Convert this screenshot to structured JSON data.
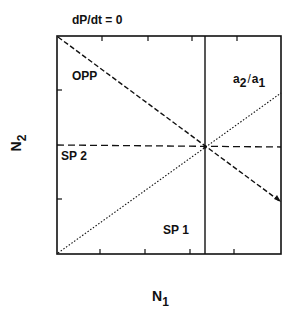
{
  "diagram": {
    "title": "dP/dt = 0",
    "x_axis": {
      "label": "N",
      "subscript": "1"
    },
    "y_axis": {
      "label": "N",
      "subscript": "2"
    },
    "regions": {
      "opp": "OPP",
      "sp2": "SP 2",
      "sp1": "SP 1"
    },
    "slope_label": {
      "a_top": "a",
      "sub_top": "2",
      "slash": "/",
      "a_bottom": "a",
      "sub_bottom": "1"
    },
    "lines": [
      {
        "name": "opp-isocline",
        "style": "dashed",
        "from": [
          0,
          1
        ],
        "to": [
          1,
          0.25
        ]
      },
      {
        "name": "sp2-isocline",
        "style": "dashed",
        "from": [
          0,
          0.5
        ],
        "to": [
          1,
          0.5
        ]
      },
      {
        "name": "sp1-isocline",
        "style": "solid",
        "from": [
          0.67,
          0
        ],
        "to": [
          0.67,
          1
        ]
      },
      {
        "name": "ratio-line",
        "style": "dotted",
        "from": [
          0,
          0
        ],
        "to": [
          1,
          0.73
        ]
      }
    ],
    "colors": {
      "ink": "#111111",
      "background": "#ffffff"
    }
  }
}
